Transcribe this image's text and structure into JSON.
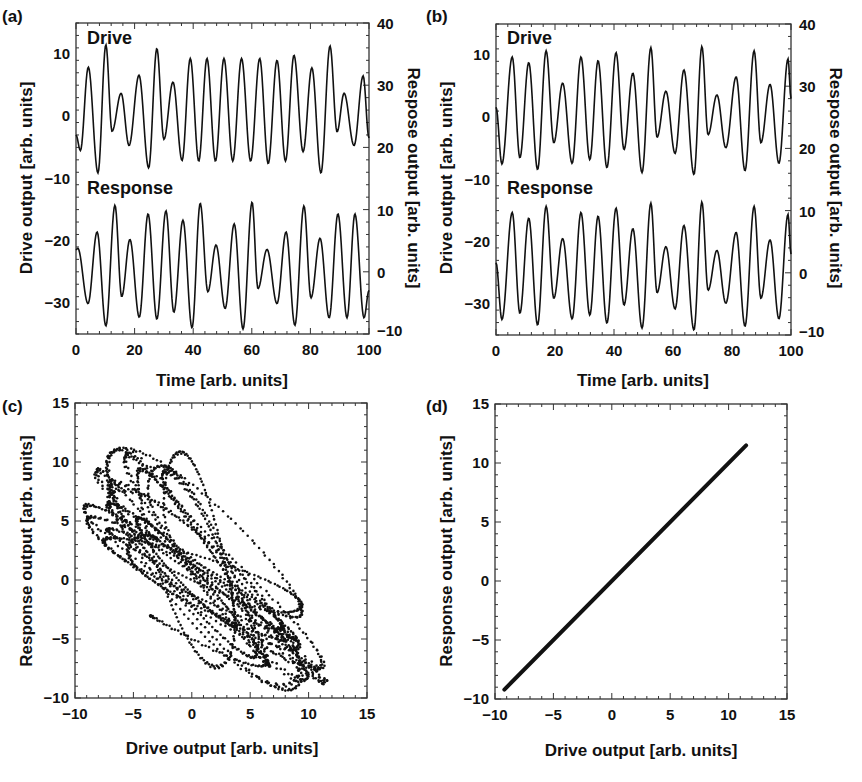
{
  "figure": {
    "panels": [
      {
        "id": "a",
        "label": "(a)"
      },
      {
        "id": "b",
        "label": "(b)"
      },
      {
        "id": "c",
        "label": "(c)"
      },
      {
        "id": "d",
        "label": "(d)"
      }
    ],
    "timeseries_labels": {
      "drive": "Drive",
      "response": "Response",
      "xlabel": "Time [arb. units]",
      "ylabel_left": "Drive output [arb. units]",
      "ylabel_right": "Respose output [arb. units]"
    },
    "scatter_labels": {
      "xlabel": "Drive output [arb. units]",
      "ylabel": "Response output [arb. units]"
    },
    "colors": {
      "line": "#111111",
      "axes": "#333333",
      "background": "#ffffff"
    }
  },
  "chart_data": [
    {
      "panel": "(a)",
      "type": "line",
      "title": "",
      "xlabel": "Time [arb. units]",
      "ylabel": "Drive output [arb. units]",
      "ylabel_right": "Respose output [arb. units]",
      "xlim": [
        0,
        100
      ],
      "ylim": [
        -35,
        15
      ],
      "ylim_right": [
        -10,
        40
      ],
      "xticks": [
        0,
        20,
        40,
        60,
        80,
        100
      ],
      "yticks": [
        -30,
        -20,
        -10,
        0,
        10
      ],
      "yticks_right": [
        -10,
        0,
        10,
        20,
        30,
        40
      ],
      "annotations": [
        "Drive",
        "Response"
      ],
      "series": [
        {
          "name": "Drive",
          "axis": "left",
          "x": [
            0,
            1.5,
            4.2,
            7.5,
            10.2,
            12.3,
            15.4,
            18.1,
            21.5,
            24.8,
            27.6,
            30.0,
            33.1,
            36.2,
            39.0,
            41.9,
            44.7,
            47.6,
            50.5,
            53.5,
            56.5,
            59.6,
            62.7,
            65.6,
            68.6,
            71.5,
            74.4,
            77.5,
            80.5,
            83.6,
            86.7,
            89.1,
            91.5,
            94.9,
            98.0,
            100
          ],
          "y": [
            -3,
            -5.5,
            7.9,
            -9.1,
            11.5,
            -2.4,
            3.7,
            -4.7,
            6.6,
            -8.3,
            10.9,
            -3.7,
            5.5,
            -7.1,
            9.3,
            -7.2,
            9.3,
            -7.2,
            9.3,
            -7.2,
            9.3,
            -7.2,
            9.3,
            -7.6,
            9.0,
            -7.2,
            9.8,
            -5.7,
            7.8,
            -9.1,
            11.3,
            -2.5,
            3.7,
            -4.7,
            6.5,
            -3.5
          ]
        },
        {
          "name": "Response",
          "axis": "right",
          "x": [
            0,
            0.6,
            4.1,
            7.2,
            10.2,
            13.3,
            15.6,
            18.4,
            21.6,
            24.6,
            27.6,
            30.7,
            33.4,
            36.5,
            39.6,
            42.4,
            45.0,
            47.8,
            50.9,
            54.0,
            57.0,
            60.1,
            62.1,
            65.2,
            68.6,
            71.7,
            74.7,
            77.8,
            80.2,
            83.3,
            86.4,
            89.4,
            92.5,
            95.2,
            98.3,
            100
          ],
          "y": [
            3.5,
            3.8,
            -5.1,
            6.4,
            -8.7,
            10.7,
            -4.0,
            5.2,
            -7.3,
            9.3,
            -7.6,
            9.8,
            -6.5,
            8.3,
            -9.0,
            11.0,
            -3.2,
            4.3,
            -5.9,
            7.7,
            -9.2,
            11.2,
            -2.7,
            3.6,
            -5.1,
            6.4,
            -8.6,
            10.6,
            -4.2,
            5.4,
            -7.4,
            9.3,
            -7.4,
            9.3,
            -7.4,
            -3.0
          ]
        }
      ]
    },
    {
      "panel": "(b)",
      "type": "line",
      "title": "",
      "xlabel": "Time [arb. units]",
      "ylabel": "Drive output [arb. units]",
      "ylabel_right": "Respose output [arb. units]",
      "xlim": [
        0,
        100
      ],
      "ylim": [
        -35,
        15
      ],
      "ylim_right": [
        -10,
        40
      ],
      "xticks": [
        0,
        20,
        40,
        60,
        80,
        100
      ],
      "yticks": [
        -30,
        -20,
        -10,
        0,
        10
      ],
      "yticks_right": [
        -10,
        0,
        10,
        20,
        30,
        40
      ],
      "annotations": [
        "Drive",
        "Response"
      ],
      "series": [
        {
          "name": "Drive",
          "axis": "left",
          "x": [
            0,
            2.0,
            5.5,
            8.1,
            11.1,
            14.1,
            17.0,
            19.6,
            22.6,
            25.8,
            28.8,
            31.8,
            34.6,
            37.6,
            40.7,
            43.4,
            46.4,
            49.5,
            52.5,
            54.6,
            57.6,
            60.7,
            63.7,
            67.1,
            69.8,
            71.9,
            74.9,
            77.9,
            81.4,
            84.4,
            87.5,
            89.8,
            92.9,
            95.9,
            99.0,
            100
          ],
          "y": [
            1.6,
            -7.5,
            9.7,
            -6.5,
            8.8,
            -8.4,
            10.7,
            -4.1,
            5.5,
            -7.4,
            9.7,
            -6.8,
            9.1,
            -8.1,
            10.4,
            -5.2,
            7.1,
            -8.9,
            11.2,
            -3.2,
            4.2,
            -5.8,
            7.6,
            -9.2,
            11.4,
            -2.8,
            3.6,
            -4.9,
            6.5,
            -8.6,
            10.7,
            -4.1,
            5.3,
            -7.4,
            9.4,
            3.0
          ]
        },
        {
          "name": "Response",
          "axis": "right",
          "x": [
            0,
            2.0,
            5.5,
            8.1,
            11.1,
            14.1,
            17.0,
            19.6,
            22.6,
            25.8,
            28.8,
            31.8,
            34.6,
            37.6,
            40.7,
            43.4,
            46.4,
            49.5,
            52.5,
            54.6,
            57.6,
            60.7,
            63.7,
            67.1,
            69.8,
            71.9,
            74.9,
            77.9,
            81.4,
            84.4,
            87.5,
            89.8,
            92.9,
            95.9,
            99.0,
            100
          ],
          "y": [
            1.6,
            -7.5,
            9.7,
            -6.5,
            8.8,
            -8.4,
            10.7,
            -4.1,
            5.5,
            -7.4,
            9.7,
            -6.8,
            9.1,
            -8.1,
            10.4,
            -5.2,
            7.1,
            -8.9,
            11.2,
            -3.2,
            4.2,
            -5.8,
            7.6,
            -9.2,
            11.4,
            -2.8,
            3.6,
            -4.9,
            6.5,
            -8.6,
            10.7,
            -4.1,
            5.3,
            -7.4,
            9.4,
            3.0
          ]
        }
      ]
    },
    {
      "panel": "(c)",
      "type": "scatter",
      "title": "",
      "xlabel": "Drive output [arb. units]",
      "ylabel": "Response output [arb. units]",
      "xlim": [
        -10,
        15
      ],
      "ylim": [
        -10,
        15
      ],
      "xticks": [
        -10,
        -5,
        0,
        5,
        10,
        15
      ],
      "yticks": [
        -10,
        -5,
        0,
        5,
        10,
        15
      ],
      "description": "Dense dotted cloud of Drive(t) vs Response(t) from panel (a); unsynchronized, spanning x≈-9..11.5, y≈-9..11.5",
      "source_series": "(a)",
      "extent": {
        "x": [
          -9.1,
          11.5
        ],
        "y": [
          -9.2,
          11.2
        ]
      }
    },
    {
      "panel": "(d)",
      "type": "line",
      "title": "",
      "xlabel": "Drive output [arb. units]",
      "ylabel": "Response output [arb. units]",
      "xlim": [
        -10,
        15
      ],
      "ylim": [
        -10,
        15
      ],
      "xticks": [
        -10,
        -5,
        0,
        5,
        10,
        15
      ],
      "yticks": [
        -10,
        -5,
        0,
        5,
        10,
        15
      ],
      "series": [
        {
          "name": "Response vs Drive (synchronized)",
          "x": [
            -9.2,
            11.5
          ],
          "y": [
            -9.2,
            11.5
          ]
        }
      ]
    }
  ]
}
